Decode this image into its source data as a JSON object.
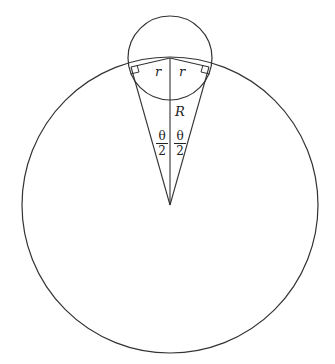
{
  "diagram": {
    "type": "geometry",
    "labels": {
      "r_left": "r",
      "r_right": "r",
      "R": "R",
      "theta_half_left": {
        "numerator": "θ",
        "denominator": "2"
      },
      "theta_half_right": {
        "numerator": "θ",
        "denominator": "2"
      }
    },
    "colors": {
      "stroke": "#333333",
      "background": "#ffffff"
    }
  }
}
